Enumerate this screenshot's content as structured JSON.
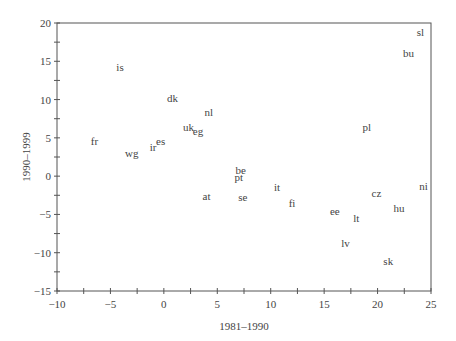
{
  "chart_data": {
    "type": "scatter",
    "title": "",
    "xlabel": "1981–1990",
    "ylabel": "1990–1999",
    "xlim": [
      -10,
      25
    ],
    "ylim": [
      -15,
      20
    ],
    "x_ticks": [
      -10,
      -5,
      0,
      5,
      10,
      15,
      20,
      25
    ],
    "y_ticks": [
      -15,
      -10,
      -5,
      0,
      5,
      10,
      15,
      20
    ],
    "grid": false,
    "legend": null,
    "points": [
      {
        "label": "is",
        "x": -4.1,
        "y": 14.3
      },
      {
        "label": "dk",
        "x": 0.8,
        "y": 10.2
      },
      {
        "label": "nl",
        "x": 4.2,
        "y": 8.4
      },
      {
        "label": "fr",
        "x": -6.5,
        "y": 4.6
      },
      {
        "label": "uk",
        "x": 2.3,
        "y": 6.4
      },
      {
        "label": "eg",
        "x": 3.2,
        "y": 5.9
      },
      {
        "label": "es",
        "x": -0.3,
        "y": 4.6
      },
      {
        "label": "ir",
        "x": -1.0,
        "y": 3.8
      },
      {
        "label": "wg",
        "x": -3.0,
        "y": 3.0
      },
      {
        "label": "pl",
        "x": 19.0,
        "y": 6.4
      },
      {
        "label": "be",
        "x": 7.2,
        "y": 0.8
      },
      {
        "label": "pt",
        "x": 7.0,
        "y": -0.1
      },
      {
        "label": "at",
        "x": 4.0,
        "y": -2.6
      },
      {
        "label": "se",
        "x": 7.4,
        "y": -2.7
      },
      {
        "label": "it",
        "x": 10.6,
        "y": -1.4
      },
      {
        "label": "fi",
        "x": 12.0,
        "y": -3.5
      },
      {
        "label": "ee",
        "x": 16.0,
        "y": -4.6
      },
      {
        "label": "lt",
        "x": 18.0,
        "y": -5.5
      },
      {
        "label": "cz",
        "x": 19.9,
        "y": -2.2
      },
      {
        "label": "hu",
        "x": 22.0,
        "y": -4.2
      },
      {
        "label": "ni",
        "x": 24.3,
        "y": -1.3
      },
      {
        "label": "lv",
        "x": 17.0,
        "y": -8.7
      },
      {
        "label": "sk",
        "x": 21.0,
        "y": -11.1
      },
      {
        "label": "sl",
        "x": 24.0,
        "y": 18.8
      },
      {
        "label": "bu",
        "x": 22.9,
        "y": 16.1
      }
    ]
  },
  "colors": {
    "axis": "#555555",
    "text": "#444444",
    "background": "#ffffff"
  }
}
